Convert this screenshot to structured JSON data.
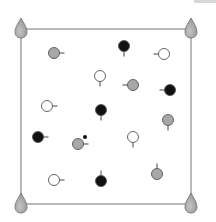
{
  "diagram": {
    "frame": {
      "x1": 21,
      "y1": 29,
      "x2": 191,
      "y2": 204,
      "stroke": "#8a8a8a"
    },
    "colors": {
      "black": "#111111",
      "gray": "#a8a8a8",
      "white": "#ffffff",
      "outline": "#555555",
      "pin_fill": "#9a9a9a",
      "pin_stroke": "#6e6e6e"
    },
    "pins": [
      {
        "x": 21,
        "y": 29
      },
      {
        "x": 191,
        "y": 29
      },
      {
        "x": 21,
        "y": 204
      },
      {
        "x": 191,
        "y": 204
      }
    ],
    "particles": [
      {
        "x": 54,
        "y": 53,
        "fill": "gray",
        "tail": "right"
      },
      {
        "x": 124,
        "y": 46,
        "fill": "black",
        "tail": "down"
      },
      {
        "x": 164,
        "y": 54,
        "fill": "white",
        "tail": "left"
      },
      {
        "x": 100,
        "y": 76,
        "fill": "white",
        "tail": "down"
      },
      {
        "x": 133,
        "y": 85,
        "fill": "gray",
        "tail": "left"
      },
      {
        "x": 170,
        "y": 90,
        "fill": "black",
        "tail": "left"
      },
      {
        "x": 47,
        "y": 106,
        "fill": "white",
        "tail": "right"
      },
      {
        "x": 101,
        "y": 110,
        "fill": "black",
        "tail": "down"
      },
      {
        "x": 168,
        "y": 120,
        "fill": "gray",
        "tail": "down"
      },
      {
        "x": 38,
        "y": 137,
        "fill": "black",
        "tail": "right"
      },
      {
        "x": 78,
        "y": 144,
        "fill": "gray",
        "tail": "right"
      },
      {
        "x": 133,
        "y": 137,
        "fill": "white",
        "tail": "down"
      },
      {
        "x": 54,
        "y": 180,
        "fill": "white",
        "tail": "right"
      },
      {
        "x": 101,
        "y": 181,
        "fill": "black",
        "tail": "up"
      },
      {
        "x": 157,
        "y": 174,
        "fill": "gray",
        "tail": "up"
      }
    ],
    "small_dots": [
      {
        "x": 85,
        "y": 137,
        "fill": "black"
      }
    ]
  }
}
